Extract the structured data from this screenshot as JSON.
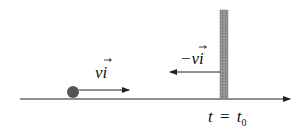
{
  "diagram": {
    "ball_velocity_label": "vi",
    "wall_velocity_label": "−vi",
    "time_label_t": "t",
    "time_label_eq": "=",
    "time_label_t0": "t",
    "time_label_sub": "0",
    "colors": {
      "ball": "#555555",
      "wall": "#8a8a8a",
      "line": "#222222"
    }
  }
}
